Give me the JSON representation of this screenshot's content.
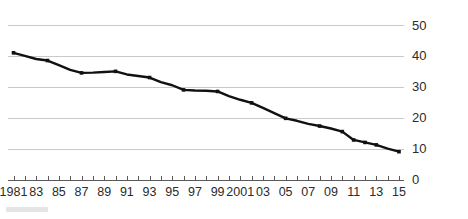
{
  "chart_data": {
    "type": "line",
    "title": "",
    "subtitle": "",
    "xlabel": "",
    "ylabel": "",
    "xlim": [
      1981,
      2015
    ],
    "ylim": [
      0,
      50
    ],
    "yticks": [
      0,
      10,
      20,
      30,
      40,
      50
    ],
    "ytick_labels": [
      "0",
      "10",
      "20",
      "30",
      "40",
      "50"
    ],
    "y_axis_position": "right",
    "grid": "horizontal",
    "legend": "none",
    "marker": "square",
    "line_color": "#111111",
    "grid_color": "#c9c9c9",
    "axis_color": "#5a5a5a",
    "x": [
      1981,
      1982,
      1983,
      1984,
      1985,
      1986,
      1987,
      1988,
      1989,
      1990,
      1991,
      1992,
      1993,
      1994,
      1995,
      1996,
      1997,
      1998,
      1999,
      2000,
      2001,
      2002,
      2003,
      2004,
      2005,
      2006,
      2007,
      2008,
      2009,
      2010,
      2011,
      2012,
      2013,
      2014,
      2015
    ],
    "xtick_labels": [
      "1981",
      "",
      "83",
      "",
      "85",
      "",
      "87",
      "",
      "89",
      "",
      "91",
      "",
      "93",
      "",
      "95",
      "",
      "97",
      "",
      "99",
      "",
      "2001",
      "",
      "03",
      "",
      "05",
      "",
      "07",
      "",
      "09",
      "",
      "11",
      "",
      "13",
      "",
      "15"
    ],
    "values": [
      41.0,
      40.0,
      39.0,
      38.5,
      37.0,
      35.5,
      34.5,
      34.6,
      34.8,
      35.0,
      34.0,
      33.5,
      33.0,
      31.5,
      30.5,
      29.0,
      28.8,
      28.7,
      28.5,
      27.0,
      25.8,
      24.8,
      23.2,
      21.5,
      19.8,
      19.0,
      18.0,
      17.3,
      16.5,
      15.5,
      12.8,
      12.0,
      11.2,
      10.0,
      9.0
    ],
    "marker_years": [
      1981,
      1984,
      1987,
      1990,
      1993,
      1996,
      1999,
      2002,
      2005,
      2008,
      2010,
      2011,
      2012,
      2013,
      2015
    ],
    "series": [
      {
        "name": "",
        "values": [
          41.0,
          40.0,
          39.0,
          38.5,
          37.0,
          35.5,
          34.5,
          34.6,
          34.8,
          35.0,
          34.0,
          33.5,
          33.0,
          31.5,
          30.5,
          29.0,
          28.8,
          28.7,
          28.5,
          27.0,
          25.8,
          24.8,
          23.2,
          21.5,
          19.8,
          19.0,
          18.0,
          17.3,
          16.5,
          15.5,
          12.8,
          12.0,
          11.2,
          10.0,
          9.0
        ]
      }
    ]
  }
}
